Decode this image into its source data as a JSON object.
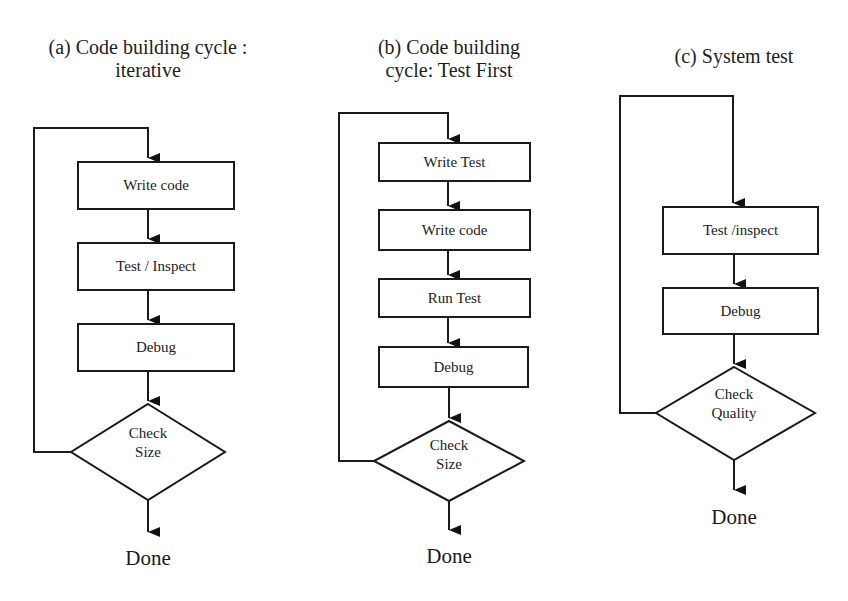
{
  "diagrams": [
    {
      "title_line1": "(a) Code building cycle :",
      "title_line2": "iterative",
      "steps": [
        "Write code",
        "Test / Inspect",
        "Debug"
      ],
      "decision_line1": "Check",
      "decision_line2": "Size",
      "end_label": "Done"
    },
    {
      "title_line1": "(b) Code building",
      "title_line2": "cycle: Test First",
      "steps": [
        "Write Test",
        "Write code",
        "Run Test",
        "Debug"
      ],
      "decision_line1": "Check",
      "decision_line2": "Size",
      "end_label": "Done"
    },
    {
      "title_line1": "(c) System test",
      "steps": [
        "Test /inspect",
        "Debug"
      ],
      "decision_line1": "Check",
      "decision_line2": "Quality",
      "end_label": "Done"
    }
  ]
}
